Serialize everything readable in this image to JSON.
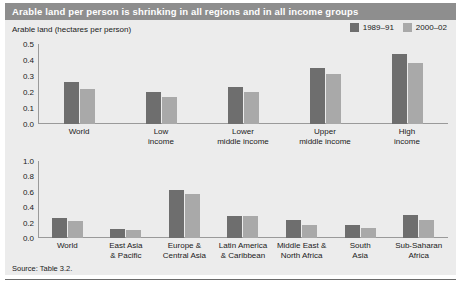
{
  "title": "Arable land per person is shrinking in all regions and in all income groups",
  "axis_title": "Arable land (hectares per person)",
  "source": "Source: Table 3.2.",
  "colors": {
    "series_1": "#6e6e6e",
    "series_2": "#a9a9a9",
    "banner": "#8e8e8e",
    "panel": "#ececec",
    "axis": "#9a9a9a",
    "text": "#1a1a1a"
  },
  "legend": {
    "position": "top-right",
    "items": [
      {
        "label": "1989–91",
        "color": "#6e6e6e"
      },
      {
        "label": "2000–02",
        "color": "#a9a9a9"
      }
    ]
  },
  "chart_data": [
    {
      "type": "bar",
      "title": "Arable land per person by income group",
      "subtitle": "",
      "xlabel": "",
      "ylabel": "Arable land (hectares per person)",
      "ylim": [
        0.0,
        0.5
      ],
      "yticks": [
        "0.0",
        "0.1",
        "0.2",
        "0.3",
        "0.4",
        "0.5"
      ],
      "ytick_values": [
        0.0,
        0.1,
        0.2,
        0.3,
        0.4,
        0.5
      ],
      "grid": false,
      "legend_position": "top-right",
      "categories": [
        "World",
        "Low income",
        "Lower middle income",
        "Upper middle income",
        "High income"
      ],
      "category_lines": [
        [
          "World"
        ],
        [
          "Low",
          "income"
        ],
        [
          "Lower",
          "middle income"
        ],
        [
          "Upper",
          "middle income"
        ],
        [
          "High",
          "income"
        ]
      ],
      "series": [
        {
          "name": "1989–91",
          "color": "#6e6e6e",
          "values": [
            0.26,
            0.2,
            0.23,
            0.35,
            0.44
          ]
        },
        {
          "name": "2000–02",
          "color": "#a9a9a9",
          "values": [
            0.22,
            0.17,
            0.2,
            0.31,
            0.38
          ]
        }
      ]
    },
    {
      "type": "bar",
      "title": "Arable land per person by region",
      "subtitle": "",
      "xlabel": "",
      "ylabel": "",
      "ylim": [
        0.0,
        1.0
      ],
      "yticks": [
        "0.0",
        "0.2",
        "0.4",
        "0.6",
        "0.8",
        "1.0"
      ],
      "ytick_values": [
        0.0,
        0.2,
        0.4,
        0.6,
        0.8,
        1.0
      ],
      "grid": false,
      "legend_position": "shared-top-right",
      "categories": [
        "World",
        "East Asia & Pacific",
        "Europe & Central Asia",
        "Latin America & Caribbean",
        "Middle East & North Africa",
        "South Asia",
        "Sub-Saharan Africa"
      ],
      "category_lines": [
        [
          "World"
        ],
        [
          "East Asia",
          "& Pacific"
        ],
        [
          "Europe &",
          "Central Asia"
        ],
        [
          "Latin America",
          "& Caribbean"
        ],
        [
          "Middle East &",
          "North Africa"
        ],
        [
          "South",
          "Asia"
        ],
        [
          "Sub-Saharan",
          "Africa"
        ]
      ],
      "series": [
        {
          "name": "1989–91",
          "color": "#6e6e6e",
          "values": [
            0.26,
            0.12,
            0.62,
            0.28,
            0.23,
            0.17,
            0.3
          ]
        },
        {
          "name": "2000–02",
          "color": "#a9a9a9",
          "values": [
            0.22,
            0.11,
            0.57,
            0.28,
            0.17,
            0.13,
            0.24
          ]
        }
      ]
    }
  ]
}
